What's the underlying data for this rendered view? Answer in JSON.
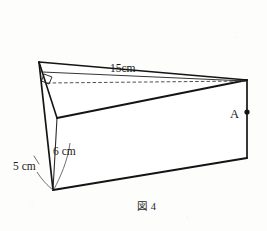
{
  "figure": {
    "caption": "図 4",
    "type": "geometry-diagram",
    "shape": "triangular-prism",
    "line_color": "#141414",
    "dashed_color": "#3a3a3a",
    "background_color": "#fdfdfc",
    "labels": {
      "diagonal_length": "15cm",
      "height_edge": "6 cm",
      "base_edge": "5 cm",
      "point_a": "A"
    },
    "markers": {
      "right_angle": "right-angle-square",
      "point_a_dot": "filled-dot"
    },
    "geometry": {
      "apex_top_left": [
        39,
        62
      ],
      "mid_left": [
        57,
        118
      ],
      "bottom_left": [
        53,
        190
      ],
      "top_right": [
        247,
        80
      ],
      "bottom_right": [
        247,
        158
      ],
      "dashed_from": [
        47,
        83
      ],
      "dashed_to": [
        246,
        81
      ]
    }
  }
}
